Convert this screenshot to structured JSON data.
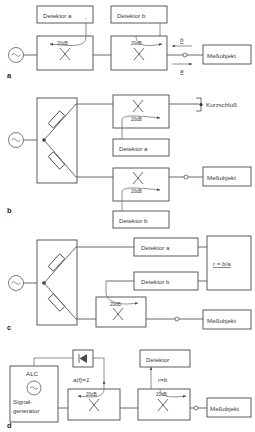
{
  "figure": {
    "type": "diagram",
    "panels": [
      "a",
      "b",
      "c",
      "d"
    ]
  },
  "labels": {
    "detektor_a": "Detektor a",
    "detektor_b": "Detektor b",
    "detektor": "Detektor",
    "messobjekt": "Meßobjekt",
    "kurzschluss": "Kurzschluß",
    "coupler_20db": "20dB",
    "ratio_formula": "r = b/a",
    "alc": "ALC",
    "signalgenerator_line1": "Signal-",
    "signalgenerator_line2": "generator",
    "alc_level": "a(f)=1",
    "reflection_eq": "r=b",
    "wave_b": "b",
    "wave_a": "a",
    "source_symbol": "~"
  },
  "panel_letters": {
    "a": "a",
    "b": "b",
    "c": "c",
    "d": "d"
  },
  "panel_a": {
    "letter": "a",
    "source": "~",
    "detector_left": "Detektor a",
    "detector_right": "Detektor b",
    "coupler_left": "20dB",
    "coupler_right": "20dB",
    "incident_wave": "a",
    "reflected_wave": "b",
    "load": "Meßobjekt"
  },
  "panel_b": {
    "letter": "b",
    "source": "~",
    "coupler_top": "20dB",
    "coupler_bottom": "20dB",
    "detector_top": "Detektor a",
    "detector_bottom": "Detektor b",
    "termination_top": "Kurzschluß",
    "termination_bottom": "Meßobjekt"
  },
  "panel_c": {
    "letter": "c",
    "source": "~",
    "detector_top": "Detektor a",
    "detector_mid": "Detektor b",
    "coupler": "20dB",
    "processor": "r = b/a",
    "load": "Meßobjekt"
  },
  "panel_d": {
    "letter": "d",
    "generator_title": "ALC",
    "generator_line1": "Signal-",
    "generator_line2": "generator",
    "generator_symbol": "~",
    "diode_box": "diode",
    "level_annotation": "a(f)=1",
    "coupler_left": "20dB",
    "coupler_right": "20dB",
    "detector": "Detektor",
    "reflection_annotation": "r=b",
    "load": "Meßobjekt"
  },
  "colors": {
    "background": "#ffffff",
    "line": "#5a5a5a",
    "box_stroke": "#4a4a4a",
    "text": "#3a3a3a"
  }
}
